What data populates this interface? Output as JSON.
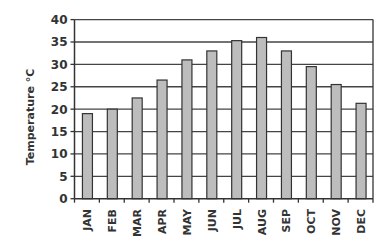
{
  "chart_data": {
    "type": "bar",
    "title": "",
    "xlabel": "",
    "ylabel": "Temperature °C",
    "categories": [
      "JAN",
      "FEB",
      "MAR",
      "APR",
      "MAY",
      "JUN",
      "JUL",
      "AUG",
      "SEP",
      "OCT",
      "NOV",
      "DEC"
    ],
    "values": [
      19,
      20,
      22.5,
      26.5,
      31,
      33,
      35.3,
      36,
      33,
      29.5,
      25.5,
      21.3
    ],
    "ylim": [
      0,
      40
    ],
    "yticks": [
      0,
      5,
      10,
      15,
      20,
      25,
      30,
      35,
      40
    ],
    "grid": true,
    "legend": null,
    "colors": {
      "bar_fill": "#bdbdbd",
      "bar_stroke": "#333333",
      "grid": "#444444",
      "axis": "#333333"
    }
  }
}
